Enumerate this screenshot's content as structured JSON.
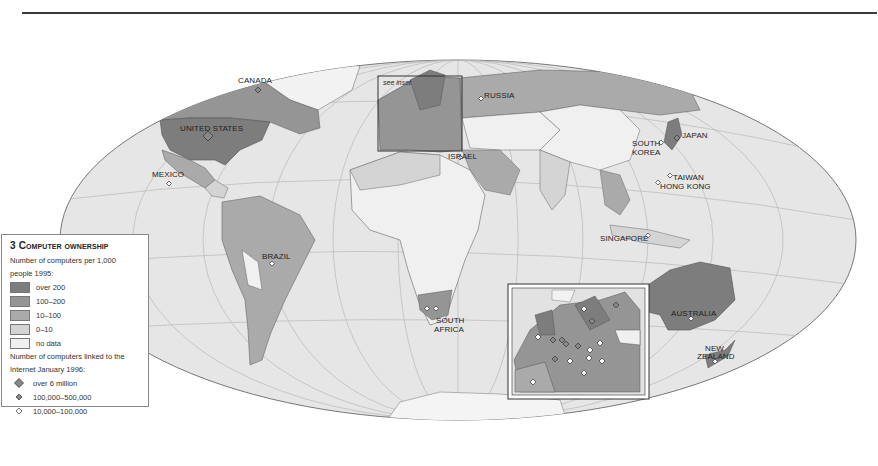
{
  "map": {
    "title_number": "3",
    "title": "Computer ownership",
    "inset_note": "see inset",
    "country_labels": [
      {
        "name": "CANADA",
        "x": 238,
        "y": 76
      },
      {
        "name": "UNITED STATES",
        "x": 180,
        "y": 124
      },
      {
        "name": "MEXICO",
        "x": 152,
        "y": 170
      },
      {
        "name": "BRAZIL",
        "x": 262,
        "y": 252
      },
      {
        "name": "RUSSIA",
        "x": 484,
        "y": 91
      },
      {
        "name": "ISRAEL",
        "x": 448,
        "y": 152
      },
      {
        "name": "JAPAN",
        "x": 682,
        "y": 131
      },
      {
        "name": "SOUTH",
        "x": 632,
        "y": 139
      },
      {
        "name": "KOREA",
        "x": 632,
        "y": 148
      },
      {
        "name": "TAIWAN",
        "x": 673,
        "y": 173
      },
      {
        "name": "HONG KONG",
        "x": 660,
        "y": 182
      },
      {
        "name": "SINGAPORE",
        "x": 600,
        "y": 234
      },
      {
        "name": "SOUTH",
        "x": 436,
        "y": 316
      },
      {
        "name": "AFRICA",
        "x": 434,
        "y": 325
      },
      {
        "name": "AUSTRALIA",
        "x": 671,
        "y": 309
      },
      {
        "name": "NEW",
        "x": 705,
        "y": 344
      },
      {
        "name": "ZEALAND",
        "x": 697,
        "y": 352
      }
    ]
  },
  "legend": {
    "ownership_heading_1": "Number of computers per 1,000",
    "ownership_heading_2": "people 1995:",
    "ownership_classes": [
      {
        "label": "over 200",
        "color": "#7d7d7d"
      },
      {
        "label": "100–200",
        "color": "#959595"
      },
      {
        "label": "10–100",
        "color": "#aaaaaa"
      },
      {
        "label": "0–10",
        "color": "#d4d4d4"
      },
      {
        "label": "no data",
        "color": "#f0f0f0"
      }
    ],
    "internet_heading_1": "Number of computers linked to the",
    "internet_heading_2": "Internet January 1996:",
    "internet_classes": [
      {
        "label": "over 6 million",
        "marker": "large-diamond-filled"
      },
      {
        "label": "100,000–500,000",
        "marker": "small-diamond-filled"
      },
      {
        "label": "10,000–100,000",
        "marker": "small-diamond-open"
      }
    ]
  },
  "colors": {
    "over200": "#7d7d7d",
    "c100_200": "#959595",
    "c10_100": "#aaaaaa",
    "c0_10": "#d4d4d4",
    "nodata": "#f0f0f0",
    "ocean": "#e6e6e6",
    "graticule": "#b5b5b5"
  }
}
